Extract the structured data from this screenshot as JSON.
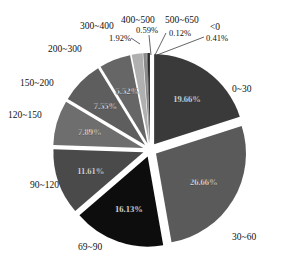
{
  "chart_data": {
    "type": "pie",
    "title": "",
    "exploded": true,
    "start_angle_deg": 0,
    "direction": "clockwise",
    "slices": [
      {
        "label": "0~30",
        "value": 19.66,
        "value_label": "19.66%",
        "color": "#3a3a3a",
        "label_inside": true
      },
      {
        "label": "30~60",
        "value": 26.66,
        "value_label": "26.66%",
        "color": "#5a5a5a",
        "label_inside": true
      },
      {
        "label": "69~90",
        "value": 16.13,
        "value_label": "16.13%",
        "color": "#0d0d0d",
        "label_inside": true
      },
      {
        "label": "90~120",
        "value": 11.61,
        "value_label": "11.61%",
        "color": "#4a4a4a",
        "label_inside": true
      },
      {
        "label": "120~150",
        "value": 7.89,
        "value_label": "7.89%",
        "color": "#6e6e6e",
        "label_inside": true
      },
      {
        "label": "150~200",
        "value": 7.55,
        "value_label": "7.55%",
        "color": "#5e5e5e",
        "label_inside": true
      },
      {
        "label": "200~300",
        "value": 5.52,
        "value_label": "5.52%",
        "color": "#666666",
        "label_inside": true
      },
      {
        "label": "300~400",
        "value": 1.92,
        "value_label": "1.92%",
        "color": "#b0b0b0",
        "label_inside": false
      },
      {
        "label": "400~500",
        "value": 0.59,
        "value_label": "0.59%",
        "color": "#8a8a8a",
        "label_inside": false
      },
      {
        "label": "500~650",
        "value": 0.12,
        "value_label": "0.12%",
        "color": "#303030",
        "label_inside": false
      },
      {
        "label": "<0",
        "value": 0.41,
        "value_label": "0.41%",
        "color": "#2a2a2a",
        "label_inside": false
      }
    ],
    "legend": null
  }
}
